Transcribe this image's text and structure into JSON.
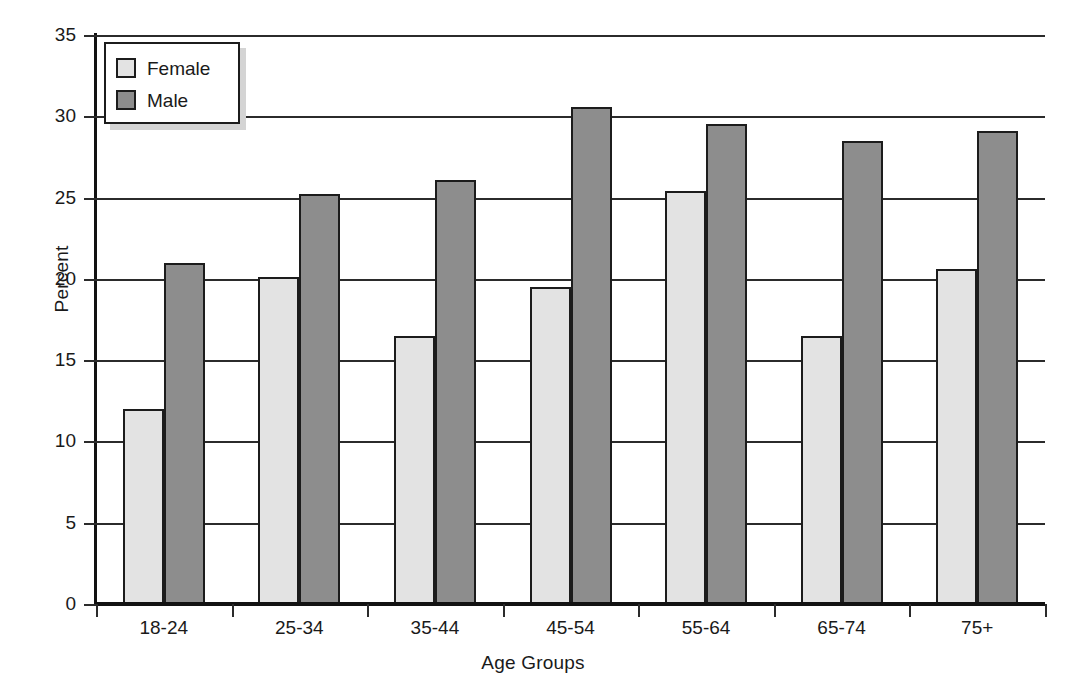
{
  "chart_data": {
    "type": "bar",
    "title": "",
    "xlabel": "Age Groups",
    "ylabel": "Percent",
    "categories": [
      "18-24",
      "25-34",
      "35-44",
      "45-54",
      "55-64",
      "65-74",
      "75+"
    ],
    "series": [
      {
        "name": "Female",
        "values": [
          12.0,
          20.1,
          16.5,
          19.5,
          25.4,
          16.5,
          20.6
        ],
        "color": "#e3e3e3"
      },
      {
        "name": "Male",
        "values": [
          21.0,
          25.2,
          26.1,
          30.6,
          29.5,
          28.5,
          29.1
        ],
        "color": "#8d8d8d"
      }
    ],
    "ylim": [
      0,
      35
    ],
    "yticks": [
      0,
      5,
      10,
      15,
      20,
      25,
      30,
      35
    ],
    "ytick_labels": [
      "0",
      "5",
      "10",
      "15",
      "20",
      "25",
      "30",
      "35"
    ],
    "grid": "horizontal",
    "legend_position": "top-left",
    "legend_entries": [
      "Female",
      "Male"
    ]
  },
  "axes": {
    "y_title": "Percent",
    "x_title": "Age Groups"
  }
}
